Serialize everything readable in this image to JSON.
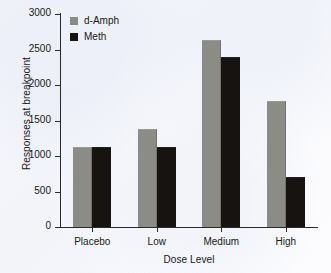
{
  "chart_data": {
    "type": "bar",
    "title": "",
    "xlabel": "Dose Level",
    "ylabel": "Responses at breakpoint",
    "categories": [
      "Placebo",
      "Low",
      "Medium",
      "High"
    ],
    "series": [
      {
        "name": "d-Amph",
        "color": "#8c8c87",
        "values": [
          1120,
          1380,
          2630,
          1780
        ]
      },
      {
        "name": "Meth",
        "color": "#161311",
        "values": [
          1120,
          1120,
          2400,
          700
        ]
      }
    ],
    "ylim": [
      0,
      3000
    ],
    "yticks": [
      0,
      500,
      1000,
      1500,
      2000,
      2500,
      3000
    ],
    "ytick_labels": [
      "0",
      "500",
      "1000",
      "1500",
      "2000",
      "2500",
      "3000"
    ],
    "grid": false,
    "legend_position": "top-left",
    "axis_color": "#2a2a2a",
    "background_color": "#fdfdff"
  }
}
